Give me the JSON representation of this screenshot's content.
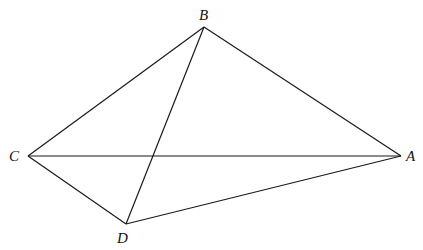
{
  "diagram": {
    "type": "geometry-quadrilateral",
    "points": {
      "A": {
        "x": 401,
        "y": 156,
        "label": "A",
        "lx": 406,
        "ly": 161
      },
      "B": {
        "x": 204,
        "y": 27,
        "label": "B",
        "lx": 199,
        "ly": 20
      },
      "C": {
        "x": 28,
        "y": 156,
        "label": "C",
        "lx": 9,
        "ly": 161
      },
      "D": {
        "x": 126,
        "y": 224,
        "label": "D",
        "lx": 117,
        "ly": 243
      }
    },
    "segments": [
      [
        "A",
        "B"
      ],
      [
        "B",
        "C"
      ],
      [
        "C",
        "D"
      ],
      [
        "D",
        "A"
      ],
      [
        "C",
        "A"
      ],
      [
        "B",
        "D"
      ]
    ],
    "stroke_color": "#1a1a1a",
    "background": "#ffffff"
  }
}
